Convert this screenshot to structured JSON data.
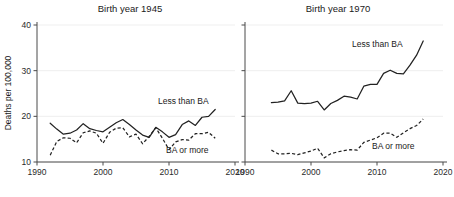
{
  "figure": {
    "ylabel": "Deaths per 100,000",
    "y_ticks": [
      "10",
      "20",
      "30",
      "40"
    ],
    "x_ticks": [
      "1990",
      "2000",
      "2010",
      "2020"
    ],
    "series_labels": {
      "less_than_ba": "Less than BA",
      "ba_or_more": "BA or more"
    },
    "ink_color": "#222222",
    "axis_color": "#4a4a4a"
  },
  "chart_data": {
    "type": "line",
    "title": "",
    "xlabel": "",
    "ylabel": "Deaths per 100,000",
    "xlim": [
      1990,
      2020
    ],
    "ylim": [
      8,
      41
    ],
    "yticks": [
      10,
      20,
      30,
      40
    ],
    "xticks": [
      1990,
      2000,
      2010,
      2020
    ],
    "grid": false,
    "legend": "inline-annotation",
    "panels": [
      {
        "title": "Birth year 1945",
        "series": [
          {
            "name": "Less than BA",
            "style": "solid",
            "x": [
              1992,
              1993,
              1994,
              1995,
              1996,
              1997,
              1998,
              1999,
              2000,
              2001,
              2002,
              2003,
              2004,
              2005,
              2006,
              2007,
              2008,
              2009,
              2010,
              2011,
              2012,
              2013,
              2014,
              2015,
              2016,
              2017
            ],
            "y": [
              18.5,
              17.2,
              16.1,
              16.3,
              17.0,
              18.4,
              17.3,
              16.9,
              16.6,
              17.6,
              18.6,
              19.3,
              18.2,
              17.0,
              15.9,
              15.4,
              17.6,
              16.6,
              15.4,
              16.0,
              18.2,
              19.0,
              18.0,
              19.8,
              20.0,
              21.5
            ]
          },
          {
            "name": "BA or more",
            "style": "dashed",
            "x": [
              1992,
              1993,
              1994,
              1995,
              1996,
              1997,
              1998,
              1999,
              2000,
              2001,
              2002,
              2003,
              2004,
              2005,
              2006,
              2007,
              2008,
              2009,
              2010,
              2011,
              2012,
              2013,
              2014,
              2015,
              2016,
              2017
            ],
            "y": [
              11.5,
              14.5,
              15.3,
              15.2,
              14.2,
              16.4,
              16.8,
              16.3,
              14.1,
              16.5,
              17.4,
              17.5,
              15.5,
              16.1,
              14.0,
              15.6,
              17.5,
              15.2,
              12.7,
              14.4,
              14.9,
              14.8,
              16.2,
              16.2,
              16.5,
              15.2
            ]
          }
        ]
      },
      {
        "title": "Birth year 1970",
        "series": [
          {
            "name": "Less than BA",
            "style": "solid",
            "x": [
              1994,
              1995,
              1996,
              1997,
              1998,
              1999,
              2000,
              2001,
              2002,
              2003,
              2004,
              2005,
              2006,
              2007,
              2008,
              2009,
              2010,
              2011,
              2012,
              2013,
              2014,
              2015,
              2016,
              2017
            ],
            "y": [
              23.0,
              23.1,
              23.4,
              25.6,
              22.9,
              22.8,
              22.9,
              23.3,
              21.4,
              22.8,
              23.5,
              24.4,
              24.2,
              23.8,
              26.6,
              27.0,
              27.0,
              29.4,
              30.1,
              29.4,
              29.3,
              31.2,
              33.4,
              36.5
            ]
          },
          {
            "name": "BA or more",
            "style": "dashed",
            "x": [
              1994,
              1995,
              1996,
              1997,
              1998,
              1999,
              2000,
              2001,
              2002,
              2003,
              2004,
              2005,
              2006,
              2007,
              2008,
              2009,
              2010,
              2011,
              2012,
              2013,
              2014,
              2015,
              2016,
              2017
            ],
            "y": [
              12.6,
              11.8,
              11.8,
              11.9,
              11.6,
              12.0,
              12.4,
              13.0,
              10.9,
              11.8,
              12.2,
              12.5,
              12.7,
              12.6,
              14.3,
              14.8,
              15.3,
              16.3,
              16.3,
              15.4,
              16.4,
              17.3,
              18.0,
              19.4
            ]
          }
        ]
      }
    ]
  }
}
